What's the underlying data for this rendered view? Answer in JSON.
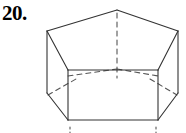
{
  "figure": {
    "problem_number": "20.",
    "shape_name": "pentagonal-prism",
    "colors": {
      "background": "#ffffff",
      "stroke": "#333333",
      "hidden_stroke": "#555555",
      "label": "#000000"
    },
    "stroke_width": 1.1,
    "hidden_dash_pattern": "5,4",
    "tick_dash_pattern": "2,3"
  },
  "geometry": {
    "top_face": {
      "name": "top-pentagon",
      "points": "117,10 178,31 158,70 68,70 47,31"
    },
    "visible_edges": [
      {
        "name": "top-edge-apex-to-left",
        "x1": 117,
        "y1": 10,
        "x2": 47,
        "y2": 31
      },
      {
        "name": "top-edge-apex-to-right",
        "x1": 117,
        "y1": 10,
        "x2": 178,
        "y2": 31
      },
      {
        "name": "top-edge-left-front",
        "x1": 47,
        "y1": 31,
        "x2": 68,
        "y2": 70
      },
      {
        "name": "top-edge-right-front",
        "x1": 178,
        "y1": 31,
        "x2": 158,
        "y2": 70
      },
      {
        "name": "top-edge-front",
        "x1": 68,
        "y1": 70,
        "x2": 158,
        "y2": 70
      },
      {
        "name": "vertical-edge-left-outer",
        "x1": 47,
        "y1": 31,
        "x2": 47,
        "y2": 93
      },
      {
        "name": "vertical-edge-left-front",
        "x1": 68,
        "y1": 70,
        "x2": 68,
        "y2": 120
      },
      {
        "name": "vertical-edge-right-front",
        "x1": 158,
        "y1": 70,
        "x2": 158,
        "y2": 120
      },
      {
        "name": "vertical-edge-right-outer",
        "x1": 178,
        "y1": 31,
        "x2": 178,
        "y2": 93
      },
      {
        "name": "bottom-edge-left-slant",
        "x1": 47,
        "y1": 93,
        "x2": 68,
        "y2": 120
      },
      {
        "name": "bottom-edge-front",
        "x1": 68,
        "y1": 120,
        "x2": 158,
        "y2": 120
      },
      {
        "name": "bottom-edge-right-slant",
        "x1": 158,
        "y1": 120,
        "x2": 178,
        "y2": 93
      }
    ],
    "hidden_edges": [
      {
        "name": "hidden-vertical-apex-drop",
        "x1": 117,
        "y1": 13,
        "x2": 117,
        "y2": 78
      },
      {
        "name": "hidden-back-edge-left",
        "x1": 68,
        "y1": 76,
        "x2": 117,
        "y2": 69
      },
      {
        "name": "hidden-back-edge-right",
        "x1": 117,
        "y1": 69,
        "x2": 158,
        "y2": 76
      },
      {
        "name": "hidden-bottom-edge-left",
        "x1": 48,
        "y1": 95,
        "x2": 76,
        "y2": 79
      },
      {
        "name": "hidden-bottom-edge-right",
        "x1": 150,
        "y1": 79,
        "x2": 177,
        "y2": 95
      }
    ],
    "bottom_ticks": [
      {
        "name": "bottom-tick-left",
        "x1": 70,
        "y1": 127,
        "x2": 70,
        "y2": 133
      },
      {
        "name": "bottom-tick-right",
        "x1": 156,
        "y1": 127,
        "x2": 156,
        "y2": 133
      }
    ]
  }
}
